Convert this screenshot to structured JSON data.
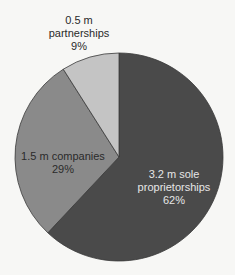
{
  "chart_data": {
    "type": "pie",
    "title": "",
    "center": [
      119,
      157
    ],
    "radius": 104,
    "start_angle_deg": 0,
    "direction": "clockwise",
    "slices": [
      {
        "name": "sole proprietorships",
        "value_text": "3.2 m sole",
        "name_text": "proprietorships",
        "count_m": 3.2,
        "percent": 62,
        "percent_text": "62%",
        "color": "#4a4a4a",
        "text_color": "#e6e6e6"
      },
      {
        "name": "companies",
        "value_text": "1.5 m companies",
        "name_text": "",
        "count_m": 1.5,
        "percent": 29,
        "percent_text": "29%",
        "color": "#8a8a8a",
        "text_color": "#2a2a2a"
      },
      {
        "name": "partnerships",
        "value_text": "0.5 m",
        "name_text": "partnerships",
        "count_m": 0.5,
        "percent": 9,
        "percent_text": "9%",
        "color": "#c4c4c4",
        "text_color": "#2a2a2a"
      }
    ],
    "categories": [
      "sole proprietorships",
      "companies",
      "partnerships"
    ],
    "values": [
      62,
      29,
      9
    ],
    "counts_millions": [
      3.2,
      1.5,
      0.5
    ],
    "legend": "none"
  }
}
